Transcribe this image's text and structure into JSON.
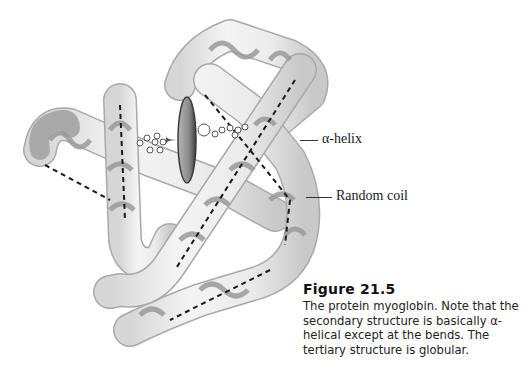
{
  "figure": {
    "title": "Figure 21.5",
    "caption": "The protein myoglobin. Note that the secondary structure is basically α-helical except at the bends. The tertiary structure is globular."
  },
  "labels": {
    "alpha_helix": "α-helix",
    "random_coil": "Random coil"
  },
  "colors": {
    "tube_fill": "#ececec",
    "tube_edge": "#a8a8a8",
    "ribbon": "#9a9a9a",
    "heme_disc": "#8a8a8a",
    "heme_edge": "#3a3a3a",
    "axis_dash": "#1a1a1a"
  }
}
